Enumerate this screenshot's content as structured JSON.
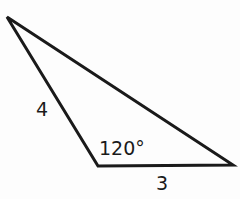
{
  "diagram": {
    "type": "triangle",
    "vertices": {
      "top": [
        7,
        17
      ],
      "bottom": [
        98,
        166
      ],
      "right": [
        233,
        165
      ]
    },
    "labels": {
      "side_left": "4",
      "angle_bottom": "120°",
      "side_bottom": "3"
    },
    "stroke_color": "#1a1a1a"
  }
}
